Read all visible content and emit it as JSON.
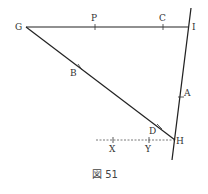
{
  "diagram": {
    "caption": "図 51",
    "points": {
      "G": "G",
      "P": "P",
      "C": "C",
      "I": "I",
      "B": "B",
      "A": "A",
      "D": "D",
      "H": "H",
      "X": "X",
      "Y": "Y"
    },
    "lines": [
      {
        "name": "GI",
        "from": "G",
        "to": "I",
        "style": "solid"
      },
      {
        "name": "GH",
        "from": "G",
        "to": "H",
        "style": "solid"
      },
      {
        "name": "IH-extended",
        "from": "I",
        "to": "H",
        "style": "solid"
      },
      {
        "name": "XY-H",
        "from": "X",
        "to": "H",
        "style": "dashed"
      }
    ],
    "colors": {
      "line": "#222222",
      "text": "#333333",
      "background": "#ffffff"
    }
  }
}
